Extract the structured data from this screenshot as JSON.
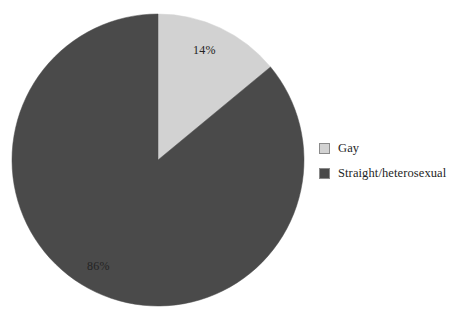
{
  "chart_data": {
    "type": "pie",
    "title": "",
    "subtitle": "",
    "xlabel": "",
    "ylabel": "",
    "categories": [
      "Gay",
      "Straight/heterosexual"
    ],
    "values": [
      14,
      86
    ],
    "value_unit": "%",
    "data_labels": [
      "14%",
      "86%"
    ],
    "colors": [
      "#d2d2d2",
      "#4a4a4a"
    ],
    "start_angle_deg": 0,
    "direction": "clockwise",
    "legend_position": "right",
    "grid": false,
    "slices": [
      {
        "label": "Gay",
        "value": 14,
        "data_label": "14%",
        "color": "#d2d2d2"
      },
      {
        "label": "Straight/heterosexual",
        "value": 86,
        "data_label": "86%",
        "color": "#4a4a4a"
      }
    ]
  },
  "legend": {
    "items": [
      {
        "label": "Gay",
        "color": "#d2d2d2"
      },
      {
        "label": "Straight/heterosexual",
        "color": "#4a4a4a"
      }
    ]
  },
  "labels": {
    "gay_pct": "14%",
    "straight_pct": "86%"
  },
  "geometry": {
    "center_x": 158,
    "center_y": 160,
    "radius": 146
  },
  "colors": {
    "background": "#ffffff",
    "light_slice": "#d2d2d2",
    "dark_slice": "#4a4a4a",
    "outline": "#8a8a8a",
    "text": "#1e1e1e"
  }
}
